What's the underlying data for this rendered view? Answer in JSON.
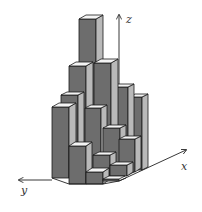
{
  "figure": {
    "type": "3D bar histogram",
    "axes": {
      "x_label": "x",
      "y_label": "y",
      "z_label": "z"
    },
    "colors": {
      "front_face": "#6d6d6d",
      "side_face": "#b9b9b9",
      "top_face": "#f4f4f4",
      "outline": "#1a1a1a"
    }
  }
}
